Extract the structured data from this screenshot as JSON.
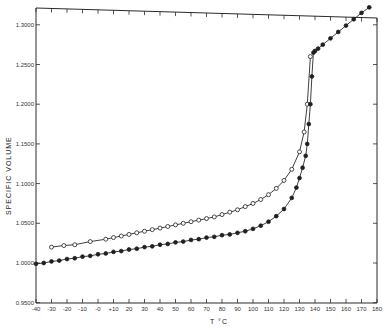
{
  "chart_data": {
    "type": "line",
    "title": "",
    "xlabel": "T °C",
    "ylabel": "SPECIFIC VOLUME",
    "xlim": [
      -40,
      180
    ],
    "ylim": [
      0.95,
      1.32
    ],
    "grid": false,
    "legend": null,
    "x_ticks": [
      -40,
      -30,
      -20,
      -10,
      0,
      10,
      20,
      30,
      40,
      50,
      60,
      70,
      80,
      90,
      100,
      110,
      120,
      130,
      140,
      150,
      160,
      170,
      180
    ],
    "x_tick_labels": [
      "-40",
      "-30",
      "-20",
      "-10",
      "-0",
      "+10",
      "20",
      "30",
      "40",
      "50",
      "60",
      "70",
      "80",
      "90",
      "100",
      "110",
      "120",
      "130",
      "140",
      "150",
      "160",
      "170",
      "180"
    ],
    "y_ticks": [
      0.95,
      1.0,
      1.05,
      1.1,
      1.15,
      1.2,
      1.25,
      1.3
    ],
    "y_tick_labels": [
      "0.9500",
      "1.0000",
      "1.0500",
      "1.1000",
      "1.1500",
      "1.2000",
      "1.2500",
      "1.3000"
    ],
    "series": [
      {
        "name": "open circles (upper curve)",
        "marker": "open-circle",
        "x": [
          -30,
          -22,
          -15,
          -5,
          5,
          10,
          15,
          20,
          25,
          30,
          35,
          40,
          45,
          50,
          55,
          60,
          65,
          70,
          75,
          80,
          85,
          90,
          95,
          100,
          105,
          110,
          115,
          120,
          125,
          130,
          133,
          135,
          137
        ],
        "y": [
          1.02,
          1.022,
          1.023,
          1.027,
          1.03,
          1.032,
          1.034,
          1.036,
          1.038,
          1.04,
          1.042,
          1.044,
          1.046,
          1.048,
          1.05,
          1.052,
          1.054,
          1.056,
          1.058,
          1.061,
          1.064,
          1.067,
          1.071,
          1.075,
          1.08,
          1.086,
          1.094,
          1.104,
          1.118,
          1.14,
          1.165,
          1.2,
          1.26
        ]
      },
      {
        "name": "filled circles (lower curve)",
        "marker": "filled-circle",
        "x": [
          -40,
          -35,
          -30,
          -25,
          -20,
          -15,
          -10,
          -5,
          0,
          5,
          10,
          15,
          20,
          25,
          30,
          35,
          40,
          45,
          50,
          55,
          60,
          65,
          70,
          75,
          80,
          85,
          90,
          95,
          100,
          105,
          110,
          115,
          120,
          125,
          128,
          130,
          132,
          134,
          135,
          136,
          137,
          138,
          139,
          140,
          142,
          145,
          150,
          155,
          160,
          165,
          170,
          175
        ],
        "y": [
          0.999,
          1.0,
          1.002,
          1.003,
          1.005,
          1.006,
          1.008,
          1.009,
          1.011,
          1.012,
          1.014,
          1.015,
          1.017,
          1.018,
          1.02,
          1.021,
          1.023,
          1.024,
          1.026,
          1.027,
          1.029,
          1.03,
          1.032,
          1.033,
          1.035,
          1.036,
          1.038,
          1.04,
          1.043,
          1.047,
          1.052,
          1.059,
          1.068,
          1.082,
          1.095,
          1.107,
          1.12,
          1.135,
          1.15,
          1.175,
          1.2,
          1.235,
          1.265,
          1.267,
          1.27,
          1.275,
          1.283,
          1.291,
          1.299,
          1.307,
          1.315,
          1.322
        ]
      }
    ]
  }
}
